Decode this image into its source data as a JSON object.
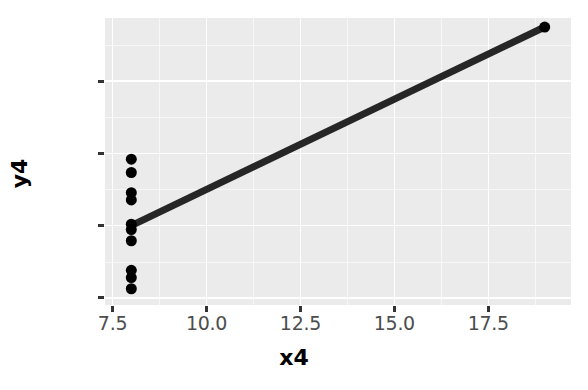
{
  "chart_data": {
    "type": "scatter",
    "title": "",
    "subtitle": "",
    "xlabel": "x4",
    "ylabel": "y4",
    "xlim": [
      7.3,
      19.7
    ],
    "ylim": [
      4.8,
      12.75
    ],
    "xticks": [
      "7.5",
      "10.0",
      "12.5",
      "15.0",
      "17.5"
    ],
    "xtick_values": [
      7.5,
      10.0,
      12.5,
      15.0,
      17.5
    ],
    "yticks": [
      "5",
      "7",
      "9",
      "11"
    ],
    "ytick_values": [
      5,
      7,
      9,
      11
    ],
    "grid": "on",
    "grid_minor": "on",
    "legend": "none",
    "x": [
      8,
      8,
      8,
      8,
      8,
      8,
      8,
      19,
      8,
      8,
      8
    ],
    "y": [
      6.58,
      5.76,
      7.71,
      8.84,
      8.47,
      7.04,
      5.25,
      12.5,
      5.56,
      7.91,
      6.89
    ],
    "points": [
      {
        "x": 8,
        "y": 6.58
      },
      {
        "x": 8,
        "y": 5.76
      },
      {
        "x": 8,
        "y": 7.71
      },
      {
        "x": 8,
        "y": 8.84
      },
      {
        "x": 8,
        "y": 8.47
      },
      {
        "x": 8,
        "y": 7.04
      },
      {
        "x": 8,
        "y": 5.25
      },
      {
        "x": 19,
        "y": 12.5
      },
      {
        "x": 8,
        "y": 5.56
      },
      {
        "x": 8,
        "y": 7.91
      },
      {
        "x": 8,
        "y": 6.89
      }
    ],
    "series": [
      {
        "name": "y4",
        "marker": "filled-circle",
        "marker_color": "#000000",
        "marker_size": 11,
        "values": [
          6.58,
          5.76,
          7.71,
          8.84,
          8.47,
          7.04,
          5.25,
          12.5,
          5.56,
          7.91,
          6.89
        ]
      }
    ],
    "trendline": {
      "type": "linear-fit",
      "color": "#262626",
      "width": 7,
      "slope": 0.4999,
      "intercept": 3.0017,
      "x_start": 8,
      "y_start": 7.0,
      "x_end": 19,
      "y_end": 12.5
    },
    "colors": {
      "panel_background": "#ebebeb",
      "gridline": "#ffffff",
      "point": "#000000",
      "line": "#262626",
      "axis_text": "#4d4d4d",
      "axis_title": "#000000",
      "tick_mark": "#333333",
      "figure_background": "#ffffff"
    }
  }
}
